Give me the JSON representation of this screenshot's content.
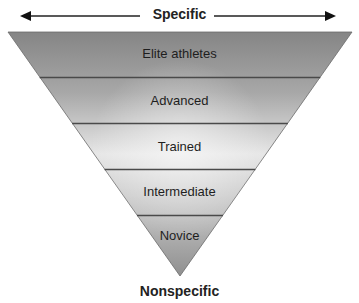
{
  "diagram": {
    "type": "inverted-pyramid",
    "top_label": "Specific",
    "bottom_label": "Nonspecific",
    "levels": [
      {
        "label": "Elite athletes"
      },
      {
        "label": "Advanced"
      },
      {
        "label": "Trained"
      },
      {
        "label": "Intermediate"
      },
      {
        "label": "Novice"
      }
    ],
    "colors": {
      "edge_dark": "#8a8a8a",
      "center_light": "#ececec",
      "divider": "#444444",
      "text": "#1e1e1e"
    }
  }
}
